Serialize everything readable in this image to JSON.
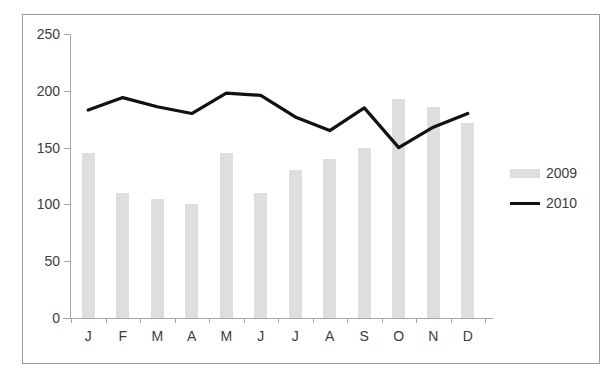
{
  "chart_data": {
    "type": "bar",
    "title": "",
    "subtitle": "",
    "xlabel": "",
    "ylabel": "",
    "categories": [
      "J",
      "F",
      "M",
      "A",
      "M",
      "J",
      "J",
      "A",
      "S",
      "O",
      "N",
      "D"
    ],
    "ylim": [
      0,
      250
    ],
    "y_ticks": [
      0,
      50,
      100,
      150,
      200,
      250
    ],
    "y_tick_labels": [
      "0",
      "50",
      "100",
      "150",
      "200",
      "250"
    ],
    "grid": false,
    "legend_position": "right",
    "series": [
      {
        "name": "2009",
        "type": "bar",
        "color": "#dedede",
        "values": [
          145,
          110,
          105,
          100,
          145,
          110,
          130,
          140,
          150,
          193,
          186,
          172
        ]
      },
      {
        "name": "2010",
        "type": "line",
        "color": "#111111",
        "values": [
          183,
          194,
          186,
          180,
          198,
          196,
          177,
          165,
          185,
          150,
          168,
          180
        ]
      }
    ]
  },
  "legend": {
    "items": [
      {
        "label": "2009",
        "marker": "bar-swatch"
      },
      {
        "label": "2010",
        "marker": "line-swatch"
      }
    ]
  },
  "colors": {
    "bar": "#dedede",
    "line": "#111111",
    "axis": "#a6a6a6",
    "frame": "#9a9a9a",
    "text": "#3d3d3d",
    "background": "#ffffff"
  }
}
